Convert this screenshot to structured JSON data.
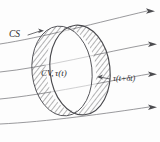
{
  "figure": {
    "background_color": "#fdfdfd",
    "ink_color": "#4a4a4e",
    "labels": {
      "control_surface": "CS",
      "control_volume": "CV, τ(t)",
      "tau_later": "τ(t+δt)"
    },
    "label_parts": {
      "cv_prefix": "CV,",
      "tau_symbol": "τ",
      "tau_arg_t": "(t)",
      "tau_arg_later": "(t+δt)"
    },
    "geometry": {
      "ellipse_cv": {
        "cx": 62,
        "cy": 71,
        "rx": 30,
        "ry": 45,
        "rotation_deg": -6
      },
      "ellipse_shifted": {
        "cx": 80,
        "cy": 70,
        "rx": 30,
        "ry": 45,
        "rotation_deg": -6
      },
      "hatch_angle_deg": 38,
      "hatch_spacing_px": 4
    },
    "streamlines": {
      "count": 4,
      "arrowhead_x": [
        150,
        152,
        152,
        152
      ],
      "arrowhead_y": [
        11,
        44,
        74,
        107
      ],
      "direction": "left-to-right"
    }
  }
}
